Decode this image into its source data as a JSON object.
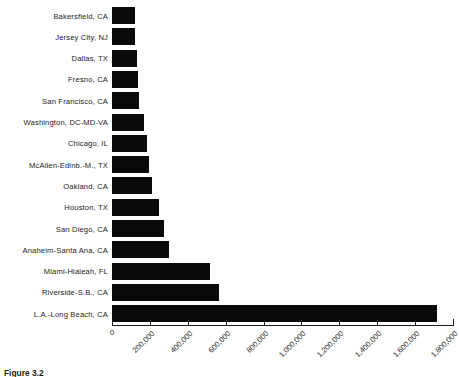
{
  "caption": {
    "label": "Figure 3.2",
    "text": "Figure 3.2"
  },
  "chart_data": {
    "type": "bar",
    "orientation": "horizontal",
    "title": "",
    "xlabel": "",
    "ylabel": "",
    "xlim": [
      0,
      1800000
    ],
    "xticks": [
      0,
      200000,
      400000,
      600000,
      800000,
      1000000,
      1200000,
      1400000,
      1600000,
      1800000
    ],
    "xtick_labels": [
      "0",
      "200,000",
      "400,000",
      "600,000",
      "800,000",
      "1,000,000",
      "1,200,000",
      "1,400,000",
      "1,600,000",
      "1,800,000"
    ],
    "grid": false,
    "legend": null,
    "bar_color": "#0a0a0a",
    "categories": [
      "Bakersfield, CA",
      "Jersey City, NJ",
      "Dallas, TX",
      "Fresno, CA",
      "San Francisco, CA",
      "Washington, DC-MD-VA",
      "Chicago, IL",
      "McAllen-Edinb.-M., TX",
      "Oakland, CA",
      "Houston, TX",
      "San Diego, CA",
      "Anaheim-Santa Ana, CA",
      "Miami-Hialeah, FL",
      "Riverside-S.B., CA",
      "L.A.-Long Beach, CA"
    ],
    "values": [
      121000,
      122000,
      132000,
      137000,
      142000,
      169000,
      185000,
      195000,
      211000,
      248000,
      274000,
      301000,
      517000,
      565000,
      1715000
    ]
  }
}
